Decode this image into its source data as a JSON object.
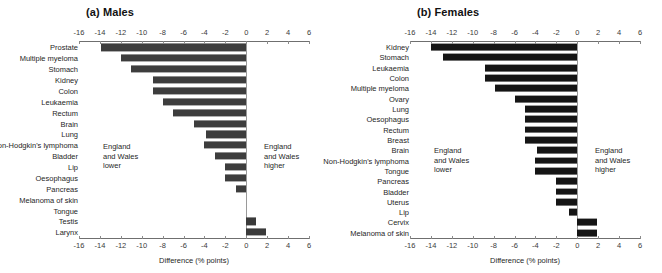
{
  "figure": {
    "xlabel": "Difference (% points)",
    "note_lower": "England\nand Wales\nlower",
    "note_higher": "England\nand Wales\nhigher",
    "tick_labels": [
      "-16",
      "-14",
      "-12",
      "-10",
      "-8",
      "-6",
      "-4",
      "-2",
      "0",
      "2",
      "4",
      "6"
    ],
    "bar_color": "#333333",
    "axis_color": "#6f6f6f"
  },
  "panels": [
    {
      "id": "males",
      "title": "(a) Males",
      "categories": [
        "Prostate",
        "Multiple myeloma",
        "Stomach",
        "Kidney",
        "Colon",
        "Leukaemia",
        "Rectum",
        "Brain",
        "Lung",
        "Non-Hodgkin's lymphoma",
        "Bladder",
        "Lip",
        "Oesophagus",
        "Pancreas",
        "Melanoma of skin",
        "Tongue",
        "Testis",
        "Larynx"
      ],
      "values": [
        -13.9,
        -12.0,
        -11.0,
        -8.9,
        -8.9,
        -8.0,
        -7.0,
        -5.0,
        -3.9,
        -4.0,
        -3.0,
        -2.0,
        -2.0,
        -1.0,
        0.0,
        0.0,
        0.9,
        1.9
      ]
    },
    {
      "id": "females",
      "title": "(b) Females",
      "categories": [
        "Kidney",
        "Stomach",
        "Leukaemia",
        "Colon",
        "Multiple myeloma",
        "Ovary",
        "Lung",
        "Oesophagus",
        "Rectum",
        "Breast",
        "Brain",
        "Non-Hodgkin's lymphoma",
        "Tongue",
        "Pancreas",
        "Bladder",
        "Uterus",
        "Lip",
        "Cervix",
        "Melanoma of skin"
      ],
      "values": [
        -14.0,
        -12.8,
        -8.8,
        -8.8,
        -7.9,
        -6.0,
        -5.0,
        -5.0,
        -5.0,
        -5.0,
        -3.9,
        -4.0,
        -4.0,
        -2.0,
        -2.0,
        -2.0,
        -0.8,
        1.9,
        1.9
      ]
    }
  ],
  "chart_data": {
    "type": "bar",
    "orientation": "horizontal",
    "title": "",
    "xlabel": "Difference (% points)",
    "ylabel": "",
    "xlim": [
      -16,
      6
    ],
    "xticks": [
      -16,
      -14,
      -12,
      -10,
      -8,
      -6,
      -4,
      -2,
      0,
      2,
      4,
      6
    ],
    "grid": false,
    "legend": "none",
    "annotations": [
      "England and Wales lower",
      "England and Wales higher"
    ],
    "panels": [
      {
        "panel_label": "(a) Males",
        "categories": [
          "Prostate",
          "Multiple myeloma",
          "Stomach",
          "Kidney",
          "Colon",
          "Leukaemia",
          "Rectum",
          "Brain",
          "Lung",
          "Non-Hodgkin's lymphoma",
          "Bladder",
          "Lip",
          "Oesophagus",
          "Pancreas",
          "Melanoma of skin",
          "Tongue",
          "Testis",
          "Larynx"
        ],
        "values": [
          -13.9,
          -12.0,
          -11.0,
          -8.9,
          -8.9,
          -8.0,
          -7.0,
          -5.0,
          -3.9,
          -4.0,
          -3.0,
          -2.0,
          -2.0,
          -1.0,
          0.0,
          0.0,
          0.9,
          1.9
        ]
      },
      {
        "panel_label": "(b) Females",
        "categories": [
          "Kidney",
          "Stomach",
          "Leukaemia",
          "Colon",
          "Multiple myeloma",
          "Ovary",
          "Lung",
          "Oesophagus",
          "Rectum",
          "Breast",
          "Brain",
          "Non-Hodgkin's lymphoma",
          "Tongue",
          "Pancreas",
          "Bladder",
          "Uterus",
          "Lip",
          "Cervix",
          "Melanoma of skin"
        ],
        "values": [
          -14.0,
          -12.8,
          -8.8,
          -8.8,
          -7.9,
          -6.0,
          -5.0,
          -5.0,
          -5.0,
          -5.0,
          -3.9,
          -4.0,
          -4.0,
          -2.0,
          -2.0,
          -2.0,
          -0.8,
          1.9,
          1.9
        ]
      }
    ]
  }
}
